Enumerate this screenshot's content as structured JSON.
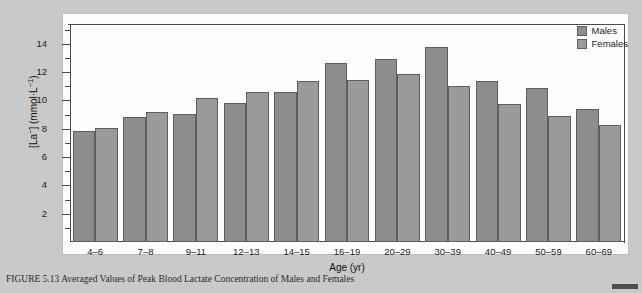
{
  "figure": {
    "caption": "FIGURE 5.13  Averaged Values of Peak Blood Lactate Concentration of Males and Females",
    "corner_mark": "page-edge-mark"
  },
  "legend": {
    "position": "top-right",
    "entries": [
      {
        "label": "Males",
        "color": "#8d8d8d"
      },
      {
        "label": "Females",
        "color": "#9a9a9a"
      }
    ]
  },
  "axes": {
    "y_title_prefix": "[La",
    "y_title_sup1": "−",
    "y_title_mid": "] (mmol·L",
    "y_title_sup2": "−1",
    "y_title_suffix": ")",
    "y_title_full": "[La−] (mmol·L−1)",
    "x_title": "Age (yr)",
    "y_major_ticks": [
      2,
      4,
      6,
      8,
      10,
      12,
      14
    ],
    "y_minor_ticks": [
      1,
      3,
      5,
      7,
      9,
      11,
      13,
      15
    ],
    "ylim": [
      0,
      15.4
    ],
    "grid": false
  },
  "chart_data": {
    "type": "bar",
    "title": "",
    "xlabel": "Age (yr)",
    "ylabel": "[La−] (mmol·L−1)",
    "ylim": [
      0,
      15.4
    ],
    "grid": false,
    "legend_position": "top-right",
    "categories": [
      "4–6",
      "7–8",
      "9–11",
      "12–13",
      "14–15",
      "16–19",
      "20–29",
      "30–39",
      "40–49",
      "50–59",
      "60–69"
    ],
    "series": [
      {
        "name": "Males",
        "color": "#8d8d8d",
        "values": [
          7.85,
          8.85,
          9.05,
          9.8,
          10.6,
          12.65,
          12.95,
          13.8,
          11.4,
          10.9,
          9.4
        ]
      },
      {
        "name": "Females",
        "color": "#9a9a9a",
        "values": [
          8.05,
          9.15,
          10.15,
          10.6,
          11.4,
          11.45,
          11.9,
          11.0,
          9.75,
          8.9,
          8.3
        ]
      }
    ]
  }
}
